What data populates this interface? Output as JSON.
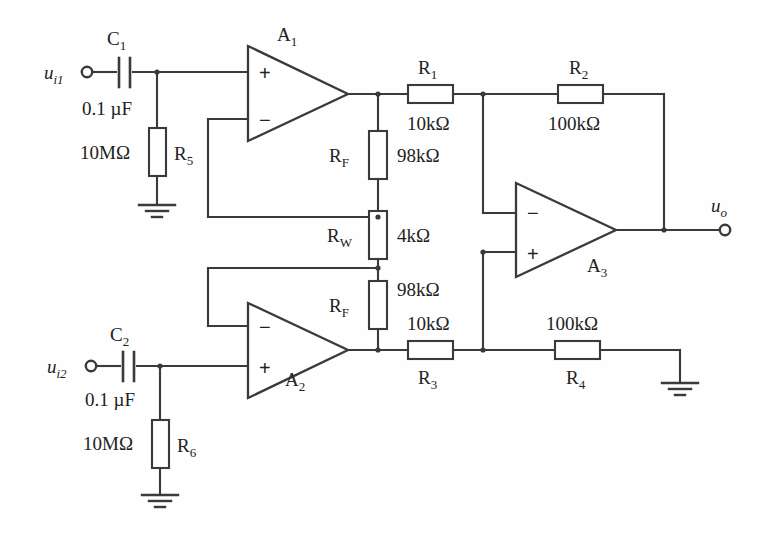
{
  "diagram": {
    "stroke_color": "#3a3a3a",
    "text_color": "#222222",
    "background": "#fefefe"
  },
  "inputs": [
    {
      "name": "input-1",
      "label": "u",
      "sub": "i1",
      "cap_ref": "C",
      "cap_sub": "1",
      "cap_value": "0.1 µF",
      "res_ref": "R",
      "res_sub": "5",
      "res_value": "10MΩ"
    },
    {
      "name": "input-2",
      "label": "u",
      "sub": "i2",
      "cap_ref": "C",
      "cap_sub": "2",
      "cap_value": "0.1 µF",
      "res_ref": "R",
      "res_sub": "6",
      "res_value": "10MΩ"
    }
  ],
  "output": {
    "label": "u",
    "sub": "o"
  },
  "opamps": [
    {
      "name": "opamp-a1",
      "ref": "A",
      "sub": "1",
      "plus": "+",
      "minus": "−"
    },
    {
      "name": "opamp-a2",
      "ref": "A",
      "sub": "2",
      "plus": "+",
      "minus": "−"
    },
    {
      "name": "opamp-a3",
      "ref": "A",
      "sub": "3",
      "plus": "+",
      "minus": "−"
    }
  ],
  "resistors": [
    {
      "name": "resistor-r1",
      "ref": "R",
      "sub": "1",
      "value": "10kΩ"
    },
    {
      "name": "resistor-r2",
      "ref": "R",
      "sub": "2",
      "value": "100kΩ"
    },
    {
      "name": "resistor-r3",
      "ref": "R",
      "sub": "3",
      "value": "10kΩ"
    },
    {
      "name": "resistor-r4",
      "ref": "R",
      "sub": "4",
      "value": "100kΩ"
    },
    {
      "name": "resistor-r5",
      "ref": "R",
      "sub": "5",
      "value": "10MΩ"
    },
    {
      "name": "resistor-r6",
      "ref": "R",
      "sub": "6",
      "value": "10MΩ"
    },
    {
      "name": "resistor-rf-top",
      "ref": "R",
      "sub": "F",
      "value": "98kΩ"
    },
    {
      "name": "resistor-rw",
      "ref": "R",
      "sub": "W",
      "value": "4kΩ"
    },
    {
      "name": "resistor-rf-bottom",
      "ref": "R",
      "sub": "F",
      "value": "98kΩ"
    }
  ],
  "capacitors": [
    {
      "name": "capacitor-c1",
      "ref": "C",
      "sub": "1",
      "value": "0.1 µF"
    },
    {
      "name": "capacitor-c2",
      "ref": "C",
      "sub": "2",
      "value": "0.1 µF"
    }
  ],
  "grounds": [
    {
      "name": "ground-r5"
    },
    {
      "name": "ground-r6"
    },
    {
      "name": "ground-r4"
    }
  ]
}
